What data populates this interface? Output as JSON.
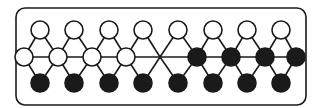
{
  "diagram": {
    "colors": {
      "stroke": "#1a1a1a",
      "open": "#ffffff",
      "filled": "#1a1a1a",
      "background": "#ffffff"
    },
    "frame": {
      "x": 16,
      "y": 8,
      "width": 290,
      "height": 97,
      "radius": 9
    },
    "node_radius": 9,
    "top_row": [
      {
        "x": 40,
        "y": 30,
        "fill": "open"
      },
      {
        "x": 74,
        "y": 30,
        "fill": "open"
      },
      {
        "x": 109,
        "y": 30,
        "fill": "open"
      },
      {
        "x": 143,
        "y": 30,
        "fill": "open"
      },
      {
        "x": 178,
        "y": 30,
        "fill": "open"
      },
      {
        "x": 213,
        "y": 30,
        "fill": "open"
      },
      {
        "x": 247,
        "y": 30,
        "fill": "open"
      },
      {
        "x": 281,
        "y": 30,
        "fill": "open"
      }
    ],
    "middle_row": [
      {
        "x": 24,
        "y": 57,
        "fill": "open"
      },
      {
        "x": 58,
        "y": 57,
        "fill": "open"
      },
      {
        "x": 92,
        "y": 57,
        "fill": "open"
      },
      {
        "x": 126,
        "y": 57,
        "fill": "open"
      },
      {
        "x": 197,
        "y": 57,
        "fill": "filled"
      },
      {
        "x": 231,
        "y": 57,
        "fill": "filled"
      },
      {
        "x": 265,
        "y": 57,
        "fill": "filled"
      },
      {
        "x": 296,
        "y": 57,
        "fill": "filled"
      }
    ],
    "bottom_row": [
      {
        "x": 40,
        "y": 83,
        "fill": "filled"
      },
      {
        "x": 74,
        "y": 83,
        "fill": "filled"
      },
      {
        "x": 109,
        "y": 83,
        "fill": "filled"
      },
      {
        "x": 143,
        "y": 83,
        "fill": "filled"
      },
      {
        "x": 178,
        "y": 83,
        "fill": "filled"
      },
      {
        "x": 213,
        "y": 83,
        "fill": "filled"
      },
      {
        "x": 247,
        "y": 83,
        "fill": "filled"
      },
      {
        "x": 281,
        "y": 83,
        "fill": "filled"
      }
    ],
    "center_crossing": {
      "x": 160,
      "y": 57
    }
  }
}
